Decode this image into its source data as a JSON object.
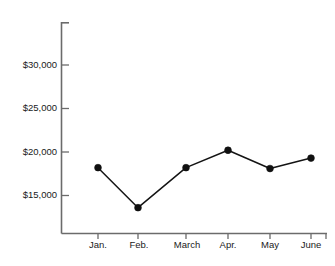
{
  "chart_data": {
    "type": "line",
    "title": "",
    "subtitle": "",
    "xlabel": "",
    "ylabel": "",
    "categories": [
      "Jan.",
      "Feb.",
      "March",
      "Apr.",
      "May",
      "June"
    ],
    "values": [
      18200,
      13600,
      18200,
      20200,
      18100,
      19300
    ],
    "series": [
      {
        "name": "",
        "values": [
          18200,
          13600,
          18200,
          20200,
          18100,
          19300
        ]
      }
    ],
    "y_tick_labels": [
      "$30,000",
      "$25,000",
      "$20,000",
      "$15,000"
    ],
    "y_tick_values": [
      30000,
      25000,
      20000,
      15000
    ],
    "ylim": [
      11000,
      32500
    ],
    "xlim": [
      0,
      7
    ],
    "grid": false,
    "legend": false,
    "legend_position": "none",
    "marker": "circle",
    "line_color": "#141414",
    "marker_color": "#101010",
    "axis_color": "#6b6b6b",
    "background_color": "#ffffff",
    "text_color": "#1a1a1a"
  },
  "axis": {
    "y_labels": [
      {
        "text": "$30,000",
        "value": 30000
      },
      {
        "text": "$25,000",
        "value": 25000
      },
      {
        "text": "$20,000",
        "value": 20000
      },
      {
        "text": "$15,000",
        "value": 15000
      }
    ],
    "x_labels": [
      {
        "text": "Jan.",
        "value": 18200
      },
      {
        "text": "Feb.",
        "value": 13600
      },
      {
        "text": "March",
        "value": 18200
      },
      {
        "text": "Apr.",
        "value": 20200
      },
      {
        "text": "May",
        "value": 18100
      },
      {
        "text": "June",
        "value": 19300
      }
    ]
  }
}
